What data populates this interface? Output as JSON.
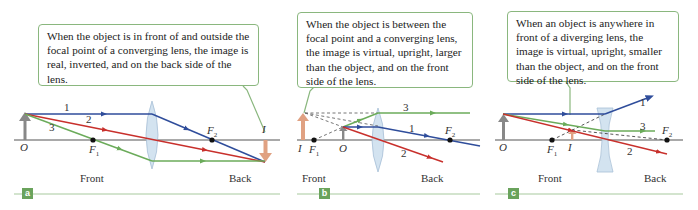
{
  "colors": {
    "ray1": "#2f4d9b",
    "ray2": "#c8302c",
    "ray3": "#6bab5a",
    "axis": "#555555",
    "object": "#888888",
    "image": "#e0a182",
    "callout_border": "#8ab77e",
    "panel_tag": "#6aa35c",
    "lens_fill": "#cfe0ef"
  },
  "panels": [
    {
      "id": "a",
      "tag": "a",
      "callout": "When the object is in front of and outside the focal point of a converging lens, the image is real, inverted, and on the back side of the lens.",
      "lens_type": "converging",
      "labels": {
        "object": "O",
        "image": "I",
        "f1": "F",
        "f1_sub": "1",
        "f2": "F",
        "f2_sub": "2",
        "front": "Front",
        "back": "Back"
      },
      "rays": [
        "1",
        "2",
        "3"
      ]
    },
    {
      "id": "b",
      "tag": "b",
      "callout": "When the object is between the focal point and a converging lens, the image is virtual, upright, larger than the object, and on the front side of the lens.",
      "lens_type": "converging",
      "labels": {
        "object": "O",
        "image": "I",
        "f1": "F",
        "f1_sub": "1",
        "f2": "F",
        "f2_sub": "2",
        "front": "Front",
        "back": "Back"
      },
      "rays": [
        "3",
        "1",
        "2"
      ]
    },
    {
      "id": "c",
      "tag": "c",
      "callout": "When an object is anywhere in front of a diverging lens, the image is virtual, upright, smaller than the object, and on the front side of the lens.",
      "lens_type": "diverging",
      "labels": {
        "object": "O",
        "image": "I",
        "f1": "F",
        "f1_sub": "1",
        "f2": "F",
        "f2_sub": "2",
        "front": "Front",
        "back": "Back"
      },
      "rays": [
        "1",
        "3",
        "2"
      ]
    }
  ]
}
